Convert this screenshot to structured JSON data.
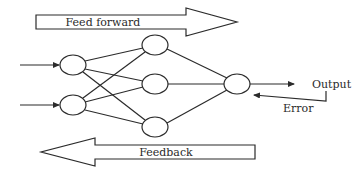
{
  "diagram": {
    "type": "neural-network-schematic",
    "labels": {
      "feed_forward": "Feed forward",
      "feedback": "Feedback",
      "output": "Output",
      "error": "Error"
    },
    "layers": {
      "input": {
        "count": 2,
        "nodes": [
          {
            "id": "in1"
          },
          {
            "id": "in2"
          }
        ]
      },
      "hidden": {
        "count": 3,
        "nodes": [
          {
            "id": "h1"
          },
          {
            "id": "h2"
          },
          {
            "id": "h3"
          }
        ]
      },
      "output": {
        "count": 1,
        "nodes": [
          {
            "id": "out1"
          }
        ]
      }
    },
    "connections": "fully-connected between consecutive layers",
    "edges": [
      [
        "input-arrow-1",
        "in1"
      ],
      [
        "input-arrow-2",
        "in2"
      ],
      [
        "in1",
        "h1"
      ],
      [
        "in1",
        "h2"
      ],
      [
        "in1",
        "h3"
      ],
      [
        "in2",
        "h1"
      ],
      [
        "in2",
        "h2"
      ],
      [
        "in2",
        "h3"
      ],
      [
        "h1",
        "out1"
      ],
      [
        "h2",
        "out1"
      ],
      [
        "h3",
        "out1"
      ],
      [
        "out1",
        "Output"
      ],
      [
        "Output",
        "out1 (Error)"
      ]
    ],
    "colors": {
      "line": "#2b2b2b",
      "background": "#ffffff"
    }
  }
}
